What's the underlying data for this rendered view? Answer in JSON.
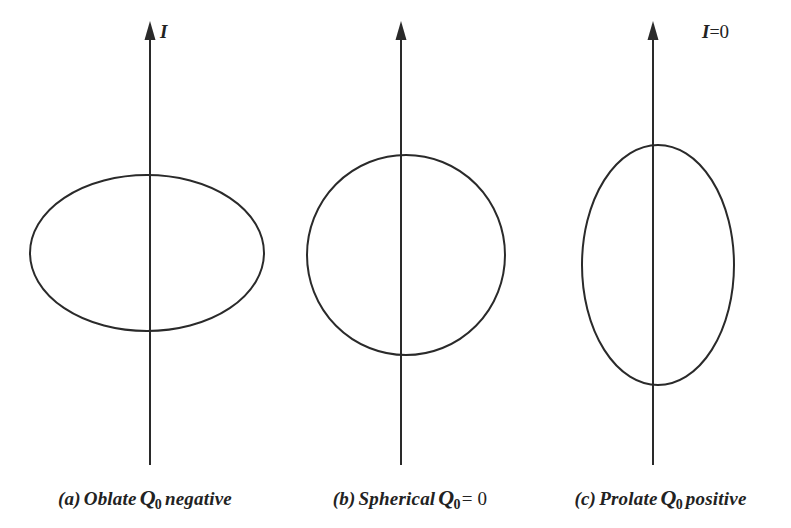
{
  "figure": {
    "type": "scientific-diagram",
    "background_color": "#ffffff",
    "stroke_color": "#2a2a2a"
  },
  "panels": [
    {
      "id": "a",
      "shape": "oblate-ellipse",
      "axis": {
        "label": "I",
        "has_equals": false,
        "equals_text": "",
        "value_text": "",
        "x": 150,
        "top_y": 22,
        "bottom_y": 465,
        "arrow_head_width": 11,
        "arrow_head_height": 17
      },
      "ellipse": {
        "cx": 147,
        "cy": 253,
        "rx": 117,
        "ry": 78
      },
      "caption": {
        "tag": "(a)",
        "shape_word": "Oblate",
        "symbol": "Q",
        "subscript": "0",
        "qualifier": "negative",
        "equals": "",
        "full_text": "(a) Oblate Q0 negative"
      }
    },
    {
      "id": "b",
      "shape": "circle",
      "axis": {
        "label": "I",
        "has_equals": true,
        "equals_text": "=",
        "value_text": "0",
        "x": 401,
        "top_y": 22,
        "bottom_y": 465,
        "arrow_head_width": 11,
        "arrow_head_height": 17
      },
      "ellipse": {
        "cx": 406,
        "cy": 255,
        "rx": 99,
        "ry": 100
      },
      "caption": {
        "tag": "(b)",
        "shape_word": "Spherical",
        "symbol": "Q",
        "subscript": "0",
        "qualifier": "",
        "equals": "= 0",
        "full_text": "(b) Spherical Q0 = 0"
      }
    },
    {
      "id": "c",
      "shape": "prolate-ellipse",
      "axis": {
        "label": "I",
        "has_equals": false,
        "equals_text": "",
        "value_text": "",
        "x": 653,
        "top_y": 22,
        "bottom_y": 465,
        "arrow_head_width": 11,
        "arrow_head_height": 17
      },
      "ellipse": {
        "cx": 658,
        "cy": 265,
        "rx": 76,
        "ry": 120
      },
      "caption": {
        "tag": "(c)",
        "shape_word": "Prolate",
        "symbol": "Q",
        "subscript": "0",
        "qualifier": "positive",
        "equals": "",
        "full_text": "(c) Prolate Q0 positive"
      }
    }
  ]
}
